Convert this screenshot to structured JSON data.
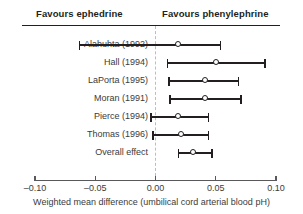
{
  "header": {
    "left_label": "Favours ephedrine",
    "right_label": "Favours phenylephrine"
  },
  "axis": {
    "caption": "Weighted mean difference (umbilical cord arterial blood pH)",
    "tick_labels": [
      "–0.10",
      "–0.05",
      "0.00",
      "0.05",
      "0.10"
    ],
    "tick_values": [
      -0.1,
      -0.05,
      0.0,
      0.05,
      0.1
    ],
    "zero_reference": 0.0
  },
  "chart_data": {
    "type": "forest",
    "title": "",
    "xlabel": "Weighted mean difference (umbilical cord arterial blood pH)",
    "ylabel": "",
    "xlim": [
      -0.1,
      0.1
    ],
    "xticks": [
      -0.1,
      -0.05,
      0.0,
      0.05,
      0.1
    ],
    "xtick_labels": [
      "–0.10",
      "–0.05",
      "0.00",
      "0.05",
      "0.10"
    ],
    "grid": false,
    "legend": "none",
    "zero_line": 0.0,
    "left_favours": "Favours ephedrine",
    "right_favours": "Favours phenylephrine",
    "marker_style": "open-circle",
    "categories": [
      "Alahuhta (1992)",
      "Hall (1994)",
      "LaPorta (1995)",
      "Moran (1991)",
      "Pierce (1994)",
      "Thomas (1996)",
      "Overall effect"
    ],
    "rows": [
      {
        "label": "Alahuhta (1992)",
        "estimate": 0.019,
        "ci_low": -0.063,
        "ci_high": 0.054,
        "is_summary": false
      },
      {
        "label": "Hall (1994)",
        "estimate": 0.05,
        "ci_low": 0.01,
        "ci_high": 0.091,
        "is_summary": false
      },
      {
        "label": "LaPorta (1995)",
        "estimate": 0.041,
        "ci_low": 0.011,
        "ci_high": 0.069,
        "is_summary": false
      },
      {
        "label": "Moran (1991)",
        "estimate": 0.041,
        "ci_low": 0.012,
        "ci_high": 0.071,
        "is_summary": false
      },
      {
        "label": "Pierce (1994)",
        "estimate": 0.019,
        "ci_low": -0.004,
        "ci_high": 0.044,
        "is_summary": false
      },
      {
        "label": "Thomas (1996)",
        "estimate": 0.021,
        "ci_low": -0.002,
        "ci_high": 0.044,
        "is_summary": false
      },
      {
        "label": "Overall effect",
        "estimate": 0.031,
        "ci_low": 0.019,
        "ci_high": 0.047,
        "is_summary": true
      }
    ]
  },
  "layout": {
    "x_pixel_min": 35,
    "x_pixel_max": 276,
    "row_top_start": 36,
    "row_height": 18
  },
  "colors": {
    "ink": "#231f20",
    "label": "#3b3b3b",
    "axis": "#58595b",
    "zero_line": "#bdbdbd",
    "marker_fill": "#ffffff"
  }
}
